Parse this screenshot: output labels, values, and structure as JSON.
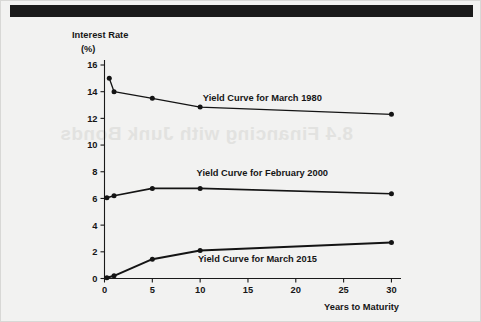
{
  "figure": {
    "background_color": "#f2f2f1",
    "border_color": "#d8d8d6",
    "top_bar_color": "#1b1b1b",
    "watermark_text": "8.4 Financing with Junk Bonds"
  },
  "chart_data": {
    "type": "line",
    "title": "",
    "subtitle": "",
    "xlabel": "Years to Maturity",
    "ylabel": "Interest Rate",
    "ylabel_units": "(%)",
    "xlim": [
      0,
      31
    ],
    "ylim": [
      0,
      16
    ],
    "xticks": [
      0,
      5,
      10,
      15,
      20,
      25,
      30
    ],
    "xtick_labels": [
      "0",
      "5",
      "10",
      "15",
      "20",
      "25",
      "30"
    ],
    "yticks": [
      0,
      2,
      4,
      6,
      8,
      10,
      12,
      14,
      16
    ],
    "ytick_labels": [
      "0",
      "2",
      "4",
      "6",
      "8",
      "10",
      "12",
      "14",
      "16"
    ],
    "grid": false,
    "legend_position": "inline-annotations",
    "line_color": "#141414",
    "marker_color": "#141414",
    "series": [
      {
        "name": "Yield Curve for March 1980",
        "label_x": 16.5,
        "label_y": 13.55,
        "x": [
          0.5,
          1,
          5,
          10,
          30
        ],
        "values": [
          15.0,
          14.0,
          13.5,
          12.85,
          12.3
        ]
      },
      {
        "name": "Yield Curve for February 2000",
        "label_x": 16.5,
        "label_y": 7.95,
        "x": [
          0.25,
          1,
          5,
          10,
          30
        ],
        "values": [
          6.05,
          6.2,
          6.75,
          6.75,
          6.35
        ]
      },
      {
        "name": "Yield Curve for March 2015",
        "label_x": 16.0,
        "label_y": 1.5,
        "x": [
          0.25,
          1,
          5,
          10,
          30
        ],
        "values": [
          0.05,
          0.2,
          1.45,
          2.1,
          2.7
        ]
      }
    ]
  }
}
